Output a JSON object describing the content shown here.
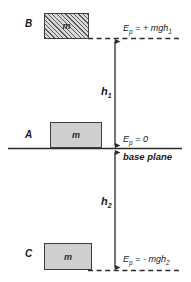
{
  "diagram": {
    "width": 191,
    "height": 282,
    "colors": {
      "line": "#2b2b2b",
      "block_fill": "#cfcfcf",
      "block_border": "#3d3d3d",
      "hatch": "#5e5e5e",
      "background": "#ffffff"
    }
  },
  "blocks": [
    {
      "id": "B",
      "label": "B",
      "mass_label": "m",
      "fill_style": "hatched",
      "position": "above-base-plane"
    },
    {
      "id": "A",
      "label": "A",
      "mass_label": "m",
      "fill_style": "solid",
      "position": "on-base-plane"
    },
    {
      "id": "C",
      "label": "C",
      "mass_label": "m",
      "fill_style": "solid",
      "position": "below-base-plane"
    }
  ],
  "energy_labels": {
    "top": {
      "symbol": "E",
      "subscript": "p",
      "equals": "= + mgh",
      "value_subscript": "1",
      "full_text": "Ep = + mgh1"
    },
    "middle": {
      "symbol": "E",
      "subscript": "p",
      "equals": "= 0",
      "value_subscript": "",
      "full_text": "Ep = 0"
    },
    "bottom": {
      "symbol": "E",
      "subscript": "p",
      "equals": "= - mgh",
      "value_subscript": "2",
      "full_text": "Ep = - mgh2"
    }
  },
  "heights": {
    "upper": {
      "symbol": "h",
      "subscript": "1"
    },
    "lower": {
      "symbol": "h",
      "subscript": "2"
    }
  },
  "base_plane": {
    "caption": "base plane"
  }
}
